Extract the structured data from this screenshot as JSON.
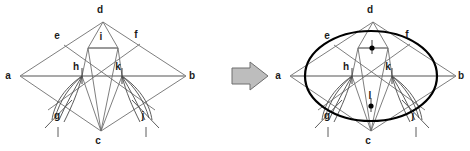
{
  "figure": {
    "canvas": {
      "width": 470,
      "height": 151,
      "background": "#ffffff"
    }
  },
  "colors": {
    "construction_line": "#6f6f6f",
    "thin_line": "#555555",
    "ellipse": "#000000",
    "label": "#1b1b1b",
    "arrow_fill": "#bdbdbd",
    "arrow_stroke": "#6e6e6e",
    "dot": "#000000"
  },
  "left_figure": {
    "name": "construction-rhombus",
    "points": [
      {
        "id": "a",
        "label": "a",
        "x": 20,
        "y": 76,
        "label_x": 8,
        "label_y": 79
      },
      {
        "id": "b",
        "label": "b",
        "x": 186,
        "y": 76,
        "label_x": 192,
        "label_y": 79
      },
      {
        "id": "d",
        "label": "d",
        "x": 103,
        "y": 22,
        "label_x": 100,
        "label_y": 13
      },
      {
        "id": "c",
        "label": "c",
        "x": 101,
        "y": 131,
        "label_x": 98,
        "label_y": 144
      },
      {
        "id": "e",
        "label": "e",
        "x": 64,
        "y": 45,
        "label_x": 57,
        "label_y": 39
      },
      {
        "id": "f",
        "label": "f",
        "x": 140,
        "y": 44,
        "label_x": 136,
        "label_y": 38
      },
      {
        "id": "i",
        "label": "i",
        "x": 102,
        "y": 48,
        "label_x": 99,
        "label_y": 40
      },
      {
        "id": "h",
        "label": "h",
        "x": 82,
        "y": 76,
        "label_x": 76,
        "label_y": 70
      },
      {
        "id": "k",
        "label": "k",
        "x": 122,
        "y": 76,
        "label_x": 118,
        "label_y": 70
      },
      {
        "id": "g",
        "label": "g",
        "x": 61,
        "y": 112,
        "label_x": 57,
        "label_y": 117
      },
      {
        "id": "j",
        "label": "j",
        "x": 142,
        "y": 112,
        "label_x": 140,
        "label_y": 117
      }
    ],
    "has_ellipse": false,
    "has_center_dots": false
  },
  "right_figure": {
    "name": "result-ellipse",
    "offset_x": 270,
    "points": [
      {
        "id": "a",
        "label": "a",
        "x": 290,
        "y": 76,
        "label_x": 278,
        "label_y": 79
      },
      {
        "id": "b",
        "label": "b",
        "x": 456,
        "y": 76,
        "label_x": 461,
        "label_y": 79
      },
      {
        "id": "d",
        "label": "d",
        "x": 373,
        "y": 22,
        "label_x": 370,
        "label_y": 13
      },
      {
        "id": "c",
        "label": "c",
        "x": 371,
        "y": 131,
        "label_x": 368,
        "label_y": 144
      },
      {
        "id": "e",
        "label": "e",
        "x": 334,
        "y": 45,
        "label_x": 327,
        "label_y": 39
      },
      {
        "id": "f",
        "label": "f",
        "x": 410,
        "y": 44,
        "label_x": 406,
        "label_y": 38
      },
      {
        "id": "h",
        "label": "h",
        "x": 352,
        "y": 76,
        "label_x": 346,
        "label_y": 70
      },
      {
        "id": "k",
        "label": "k",
        "x": 392,
        "y": 76,
        "label_x": 388,
        "label_y": 70
      },
      {
        "id": "g",
        "label": "g",
        "x": 331,
        "y": 112,
        "label_x": 327,
        "label_y": 117
      },
      {
        "id": "j",
        "label": "j",
        "x": 412,
        "y": 112,
        "label_x": 410,
        "label_y": 117
      },
      {
        "id": "l",
        "label": "l",
        "x": 371,
        "y": 106,
        "label_x": 369,
        "label_y": 99
      }
    ],
    "ellipse": {
      "cx": 371,
      "cy": 76,
      "rx": 66,
      "ry": 45,
      "stroke_width": 2.2
    },
    "center_dots": [
      {
        "id": "dot-upper",
        "x": 372,
        "y": 48,
        "r": 2.6
      },
      {
        "id": "dot-lower",
        "x": 371,
        "y": 106,
        "r": 2.6
      }
    ],
    "has_ellipse": true,
    "has_center_dots": true
  },
  "arrow": {
    "name": "transform-arrow",
    "x": 232,
    "y": 62,
    "width": 36,
    "height": 28
  }
}
